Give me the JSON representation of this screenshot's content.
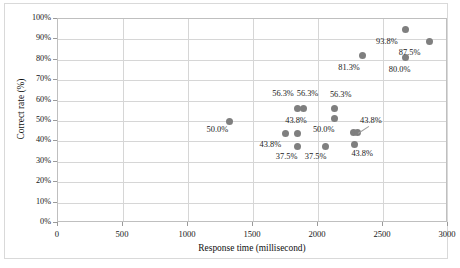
{
  "chart_data": {
    "type": "scatter",
    "title": "",
    "xlabel": "Response time (millisecond)",
    "ylabel": "Correct rate (%)",
    "xlim": [
      0,
      3000
    ],
    "ylim": [
      0,
      1.0
    ],
    "xticks": [
      "0",
      "500",
      "1000",
      "1500",
      "2000",
      "2500",
      "3000"
    ],
    "xtick_values": [
      0,
      500,
      1000,
      1500,
      2000,
      2500,
      3000
    ],
    "yticks": [
      "0%",
      "10%",
      "20%",
      "30%",
      "40%",
      "50%",
      "60%",
      "70%",
      "80%",
      "90%",
      "100%"
    ],
    "ytick_values": [
      0,
      10,
      20,
      30,
      40,
      50,
      60,
      70,
      80,
      90,
      100
    ],
    "grid": "horizontal-and-vertical",
    "legend": "none",
    "marker_color": "#7f7f7f",
    "points": [
      {
        "x": 1320,
        "y": 50.0,
        "label": "50.0%",
        "label_dx": -14,
        "label_dy": 9
      },
      {
        "x": 1750,
        "y": 43.8,
        "label": "43.8%",
        "label_dx": -17,
        "label_dy": 11
      },
      {
        "x": 1840,
        "y": 56.3,
        "label": "56.3%",
        "label_dx": -16,
        "label_dy": -14
      },
      {
        "x": 1840,
        "y": 43.8,
        "label": "43.8%",
        "label_dx": -3,
        "label_dy": -13
      },
      {
        "x": 1845,
        "y": 37.5,
        "label": "37.5%",
        "label_dx": -13,
        "label_dy": 10
      },
      {
        "x": 1890,
        "y": 56.3,
        "label": "56.3%",
        "label_dx": 2,
        "label_dy": -14
      },
      {
        "x": 2060,
        "y": 37.5,
        "label": "37.5%",
        "label_dx": -12,
        "label_dy": 10
      },
      {
        "x": 2130,
        "y": 56.3,
        "label": "56.3%",
        "label_dx": 4,
        "label_dy": -13
      },
      {
        "x": 2130,
        "y": 51.0,
        "label": "50.0%",
        "label_dx": -13,
        "label_dy": 11
      },
      {
        "x": 2270,
        "y": 44.5,
        "label": "43.8%",
        "label_dx": 16,
        "label_dy": -11
      },
      {
        "x": 2300,
        "y": 44.5,
        "label": "",
        "label_dx": 0,
        "label_dy": 0
      },
      {
        "x": 2280,
        "y": 38.5,
        "label": "43.8%",
        "label_dx": 6,
        "label_dy": 10
      },
      {
        "x": 2340,
        "y": 82.0,
        "label": "81.3%",
        "label_dx": -15,
        "label_dy": 12
      },
      {
        "x": 2670,
        "y": 95.0,
        "label": "93.8%",
        "label_dx": -20,
        "label_dy": 13
      },
      {
        "x": 2675,
        "y": 81.0,
        "label": "80.0%",
        "label_dx": -8,
        "label_dy": 12
      },
      {
        "x": 2860,
        "y": 89.0,
        "label": "87.5%",
        "label_dx": -22,
        "label_dy": 12
      }
    ],
    "leader_lines": [
      {
        "from_x": 2310,
        "from_y": 44.0,
        "to_x": 2395,
        "to_y": 47.5
      }
    ]
  }
}
